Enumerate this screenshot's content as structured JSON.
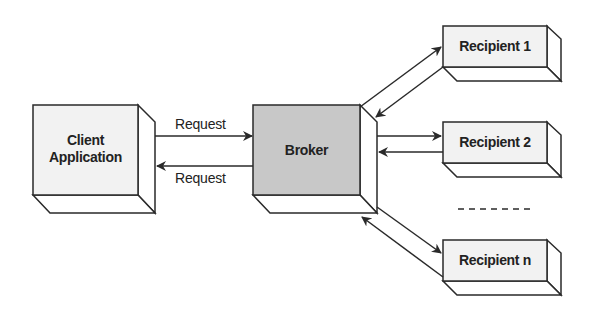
{
  "diagram": {
    "nodes": [
      {
        "id": "client",
        "label_line1": "Client",
        "label_line2": "Application",
        "fill": "#f2f2f2"
      },
      {
        "id": "broker",
        "label": "Broker",
        "fill": "#c8c8c8"
      },
      {
        "id": "recipient1",
        "label": "Recipient 1",
        "fill": "#f2f2f2"
      },
      {
        "id": "recipient2",
        "label": "Recipient 2",
        "fill": "#f2f2f2"
      },
      {
        "id": "recipientn",
        "label": "Recipient n",
        "fill": "#f2f2f2"
      }
    ],
    "edges": [
      {
        "from": "client",
        "to": "broker",
        "label": "Request"
      },
      {
        "from": "broker",
        "to": "client",
        "label": "Request"
      },
      {
        "from": "broker",
        "to": "recipient1",
        "label": ""
      },
      {
        "from": "recipient1",
        "to": "broker",
        "label": ""
      },
      {
        "from": "broker",
        "to": "recipient2",
        "label": ""
      },
      {
        "from": "recipient2",
        "to": "broker",
        "label": ""
      },
      {
        "from": "broker",
        "to": "recipientn",
        "label": ""
      },
      {
        "from": "recipientn",
        "to": "broker",
        "label": ""
      }
    ],
    "ellipsis": "- - - - - -",
    "colors": {
      "stroke": "#2a2a2a",
      "box_fill": "#f2f2f2",
      "broker_fill": "#c8c8c8",
      "side_fill": "#ffffff"
    }
  }
}
